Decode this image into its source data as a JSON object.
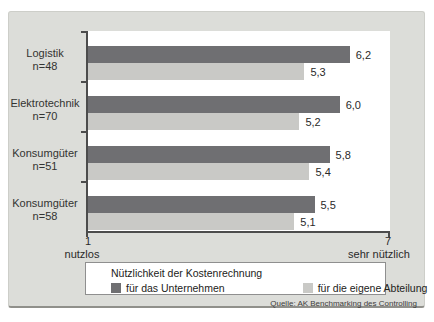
{
  "chart_data": {
    "type": "bar",
    "orientation": "horizontal",
    "categories": [
      {
        "label": "Logistik",
        "n": "n=48"
      },
      {
        "label": "Elektrotechnik",
        "n": "n=70"
      },
      {
        "label": "Konsumgüter",
        "n": "n=51"
      },
      {
        "label": "Konsumgüter",
        "n": "n=58"
      }
    ],
    "series": [
      {
        "name": "für das Unternehmen",
        "color": "#6f6f72",
        "values": [
          6.2,
          6.0,
          5.8,
          5.5
        ]
      },
      {
        "name": "für die eigene Abteilung",
        "color": "#c9c9c6",
        "values": [
          5.3,
          5.2,
          5.4,
          5.1
        ]
      }
    ],
    "xlim": [
      1,
      7
    ],
    "x_axis": {
      "min_tick": "1",
      "min_caption": "nutzlos",
      "max_tick": "7",
      "max_caption": "sehr nützlich"
    },
    "legend": {
      "title": "Nützlichkeit der Kostenrechnung",
      "position": "bottom"
    },
    "grid": false,
    "decimal_separator": ",",
    "source": "Quelle: AK Benchmarking des Controlling"
  },
  "colors": {
    "card_bg": "#dcddd9",
    "plot_bg": "#ffffff",
    "axis": "#4c4c4c",
    "legend_border": "#8f8f8f"
  }
}
